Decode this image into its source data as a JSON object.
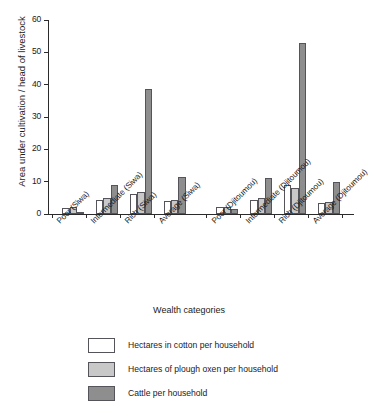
{
  "chart_data": {
    "type": "bar",
    "title": "",
    "xlabel": "Wealth categories",
    "ylabel": "Area under cultivation / head of livestock",
    "ylim": [
      0,
      60
    ],
    "yticks": [
      0,
      10,
      20,
      30,
      40,
      50,
      60
    ],
    "grid": false,
    "legend_position": "bottom",
    "categories": [
      "Poor (Siwa)",
      "Intermediate (Siwa)",
      "Rich (Siwa)",
      "Average (Siwa)",
      "Poor (Djitoumou)",
      "Intermediate (Djitoumou)",
      "Rich (Djitoumou)",
      "Average (Djitoumou)"
    ],
    "series": [
      {
        "name": "Hectares in cotton per household",
        "color": "#ffffff",
        "values": [
          2.0,
          4.4,
          6.3,
          3.9,
          2.1,
          4.2,
          8.9,
          3.5
        ]
      },
      {
        "name": "Hectares of plough oxen per household",
        "color": "#c8c8c8",
        "values": [
          2.3,
          5.0,
          6.9,
          4.2,
          2.2,
          5.0,
          8.2,
          3.8
        ]
      },
      {
        "name": "Cattle per household",
        "color": "#8e8e8e",
        "values": [
          0.7,
          9.1,
          38.8,
          11.4,
          1.5,
          11.2,
          53.0,
          10.0
        ]
      }
    ]
  },
  "legend": {
    "items": [
      {
        "label": "Hectares in cotton per household"
      },
      {
        "label": "Hectares of plough oxen per household"
      },
      {
        "label": "Cattle per household"
      }
    ]
  },
  "axis": {
    "y_title": "Area under cultivation / head of livestock",
    "x_title": "Wealth categories",
    "y_tick_labels": [
      "0",
      "10",
      "20",
      "30",
      "40",
      "50",
      "60"
    ]
  },
  "colors": {
    "cotton": "#ffffff",
    "oxen": "#c8c8c8",
    "cattle": "#8e8e8e",
    "axis": "#2b2b2b",
    "bar_outline": "#55545a",
    "background": "#ffffff"
  }
}
